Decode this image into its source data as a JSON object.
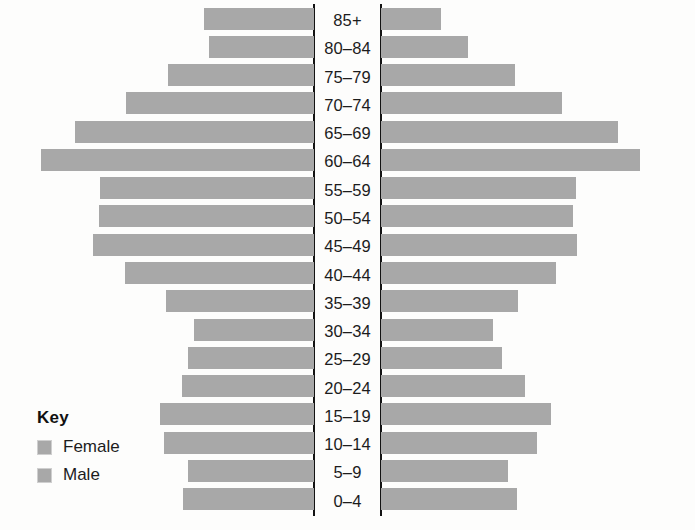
{
  "legend": {
    "title": "Key",
    "entries": [
      {
        "label": "Female",
        "color": "#a8a8a8",
        "side": "left"
      },
      {
        "label": "Male",
        "color": "#a8a8a8",
        "side": "right"
      }
    ]
  },
  "chart_data": {
    "type": "bar",
    "subtype": "population-pyramid",
    "title": "",
    "subtitle": "",
    "xlabel": "",
    "ylabel": "",
    "orientation": "horizontal",
    "grid": false,
    "legend_position": "bottom-left",
    "axis_note": "Two vertical axis lines flank the centred age-group labels; bars extend outward from each line. No numeric scale is printed on the figure.",
    "categories": [
      "85+",
      "80–84",
      "75–79",
      "70–74",
      "65–69",
      "60–64",
      "55–59",
      "50–54",
      "45–49",
      "40–44",
      "35–39",
      "30–34",
      "25–29",
      "20–24",
      "15–19",
      "10–14",
      "5–9",
      "0–4"
    ],
    "categories_order": "top-to-bottom (oldest first)",
    "series": [
      {
        "name": "Female",
        "side": "left",
        "color": "#a8a8a8",
        "unit": "bar length (px)",
        "values": [
          110,
          105,
          146,
          188,
          239,
          273,
          214,
          215,
          221,
          189,
          148,
          120,
          126,
          132,
          154,
          150,
          126,
          131
        ]
      },
      {
        "name": "Male",
        "side": "right",
        "color": "#a8a8a8",
        "unit": "bar length (px)",
        "values": [
          60,
          87,
          134,
          181,
          237,
          259,
          195,
          192,
          196,
          175,
          137,
          112,
          121,
          144,
          170,
          156,
          127,
          136
        ]
      }
    ],
    "max_value": 273
  }
}
